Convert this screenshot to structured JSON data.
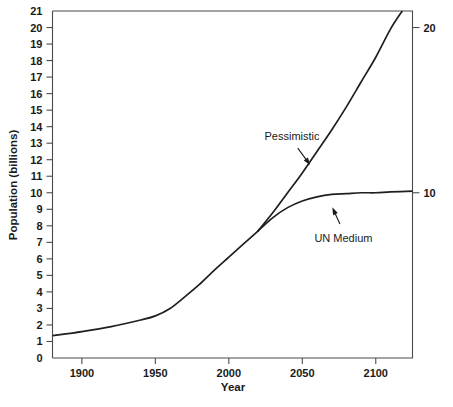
{
  "chart_data": {
    "type": "line",
    "title": "",
    "xlabel": "Year",
    "ylabel": "Population (billions)",
    "xlim": [
      1880,
      2125
    ],
    "ylim": [
      0,
      21
    ],
    "grid": false,
    "legend_position": "inline-annotations",
    "x_ticks": [
      "1900",
      "1950",
      "2000",
      "2050",
      "2100"
    ],
    "x_tick_values": [
      1900,
      1950,
      2000,
      2050,
      2100
    ],
    "y_ticks": [
      "0",
      "1",
      "2",
      "3",
      "4",
      "5",
      "6",
      "7",
      "8",
      "9",
      "10",
      "11",
      "12",
      "13",
      "14",
      "15",
      "16",
      "17",
      "18",
      "19",
      "20",
      "21"
    ],
    "y_tick_values": [
      0,
      1,
      2,
      3,
      4,
      5,
      6,
      7,
      8,
      9,
      10,
      11,
      12,
      13,
      14,
      15,
      16,
      17,
      18,
      19,
      20,
      21
    ],
    "right_axis_ticks": [
      "10",
      "20"
    ],
    "right_axis_tick_values": [
      10,
      20
    ],
    "series": [
      {
        "name": "Historical",
        "x": [
          1880,
          1900,
          1920,
          1940,
          1950,
          1960,
          1970,
          1980,
          1990,
          2000,
          2010,
          2020
        ],
        "values": [
          1.35,
          1.6,
          1.9,
          2.3,
          2.55,
          3.0,
          3.7,
          4.45,
          5.3,
          6.1,
          6.9,
          7.7
        ]
      },
      {
        "name": "Pessimistic",
        "x": [
          2020,
          2030,
          2040,
          2050,
          2060,
          2070,
          2080,
          2090,
          2100,
          2110,
          2118
        ],
        "values": [
          7.7,
          8.8,
          10.0,
          11.2,
          12.5,
          13.8,
          15.2,
          16.7,
          18.2,
          19.9,
          21.0
        ]
      },
      {
        "name": "UN Medium",
        "x": [
          2020,
          2030,
          2040,
          2050,
          2060,
          2070,
          2080,
          2090,
          2100,
          2110,
          2125
        ],
        "values": [
          7.7,
          8.5,
          9.1,
          9.5,
          9.75,
          9.9,
          9.95,
          10.0,
          10.0,
          10.05,
          10.1
        ]
      }
    ],
    "annotations": [
      {
        "id": "pessimistic",
        "label": "Pessimistic",
        "text_x": 2043,
        "text_y": 13.2,
        "target_x": 2056,
        "target_y": 11.6
      },
      {
        "id": "un-medium",
        "label": "UN Medium",
        "text_x": 2078,
        "text_y": 7.0,
        "target_x": 2070,
        "target_y": 9.2
      }
    ],
    "colors": {
      "curve": "#1f1f1f",
      "axis": "#4a4a4a",
      "text": "#1a1a1a",
      "background": "#ffffff"
    }
  }
}
